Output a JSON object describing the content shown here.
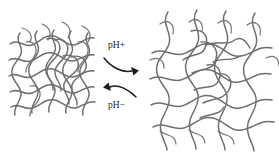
{
  "figure": {
    "type": "diagram",
    "background_color": "#ffffff",
    "network_stroke_color": "#6e6e6e",
    "arrow_color": "#1c1c1c",
    "width": 279,
    "height": 154
  },
  "labels": {
    "forward": "pH+",
    "reverse": "pH−"
  },
  "states": {
    "left": {
      "name": "collapsed-network",
      "caption": ""
    },
    "right": {
      "name": "swollen-network",
      "caption": ""
    }
  },
  "arrows": [
    {
      "name": "forward-arrow",
      "direction": "right",
      "label": "pH+"
    },
    {
      "name": "reverse-arrow",
      "direction": "left",
      "label": "pH−"
    }
  ]
}
